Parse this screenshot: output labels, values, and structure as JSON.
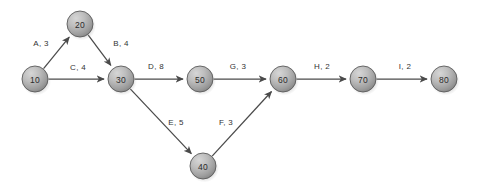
{
  "diagram": {
    "type": "directed-network",
    "background_color": "#ffffff",
    "node_fill_light": "#c8c8c8",
    "node_fill_dark": "#8d8d8d",
    "node_stroke_color": "#5a5a5a",
    "edge_color": "#4a4a4a",
    "node_radius": 13,
    "nodes": [
      {
        "id": "10",
        "label": "10",
        "x": 35,
        "y": 79
      },
      {
        "id": "20",
        "label": "20",
        "x": 80,
        "y": 24
      },
      {
        "id": "30",
        "label": "30",
        "x": 121,
        "y": 79
      },
      {
        "id": "40",
        "label": "40",
        "x": 203,
        "y": 166
      },
      {
        "id": "50",
        "label": "50",
        "x": 200,
        "y": 79
      },
      {
        "id": "60",
        "label": "60",
        "x": 283,
        "y": 79
      },
      {
        "id": "70",
        "label": "70",
        "x": 363,
        "y": 79
      },
      {
        "id": "80",
        "label": "80",
        "x": 444,
        "y": 79
      }
    ],
    "edges": [
      {
        "id": "A",
        "from": "10",
        "to": "20",
        "activity": "A",
        "duration": 3,
        "label": "A, 3",
        "label_x": 41,
        "label_y": 43
      },
      {
        "id": "B",
        "from": "20",
        "to": "30",
        "activity": "B",
        "duration": 4,
        "label": "B, 4",
        "label_x": 121,
        "label_y": 43
      },
      {
        "id": "C",
        "from": "10",
        "to": "30",
        "activity": "C",
        "duration": 4,
        "label": "C, 4",
        "label_x": 78,
        "label_y": 67
      },
      {
        "id": "D",
        "from": "30",
        "to": "50",
        "activity": "D",
        "duration": 8,
        "label": "D, 8",
        "label_x": 156,
        "label_y": 66
      },
      {
        "id": "E",
        "from": "30",
        "to": "40",
        "activity": "E",
        "duration": 5,
        "label": "E, 5",
        "label_x": 176,
        "label_y": 122
      },
      {
        "id": "F",
        "from": "40",
        "to": "60",
        "activity": "F",
        "duration": 3,
        "label": "F, 3",
        "label_x": 226,
        "label_y": 122
      },
      {
        "id": "G",
        "from": "50",
        "to": "60",
        "activity": "G",
        "duration": 3,
        "label": "G, 3",
        "label_x": 238,
        "label_y": 66
      },
      {
        "id": "H",
        "from": "60",
        "to": "70",
        "activity": "H",
        "duration": 2,
        "label": "H, 2",
        "label_x": 322,
        "label_y": 66
      },
      {
        "id": "I",
        "from": "70",
        "to": "80",
        "activity": "I",
        "duration": 2,
        "label": "I, 2",
        "label_x": 405,
        "label_y": 66
      }
    ]
  }
}
